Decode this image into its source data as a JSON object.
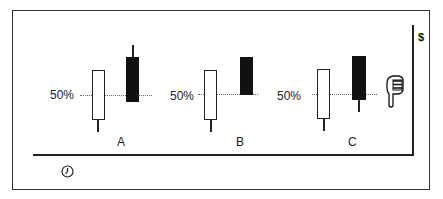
{
  "diagram": {
    "y_axis_label": "$",
    "x_axis_icon": "clock-icon",
    "pointer_icon": "hand-pointing-down-icon",
    "reference_line_label": "50%",
    "patterns": [
      {
        "label": "A",
        "pct_label": "50%",
        "first_candle": "white",
        "second_candle": "black",
        "second_candle_note": "opens above, closes at 50% of white body, upper wick"
      },
      {
        "label": "B",
        "pct_label": "50%",
        "first_candle": "white",
        "second_candle": "black",
        "second_candle_note": "opens above, closes at 50% of white body, no wicks"
      },
      {
        "label": "C",
        "pct_label": "50%",
        "first_candle": "white",
        "second_candle": "black",
        "second_candle_note": "closes at 50% of white body, lower wick"
      }
    ],
    "colors": {
      "bullish_fill": "#ffffff",
      "bearish_fill": "#111111",
      "line": "#222222"
    }
  }
}
